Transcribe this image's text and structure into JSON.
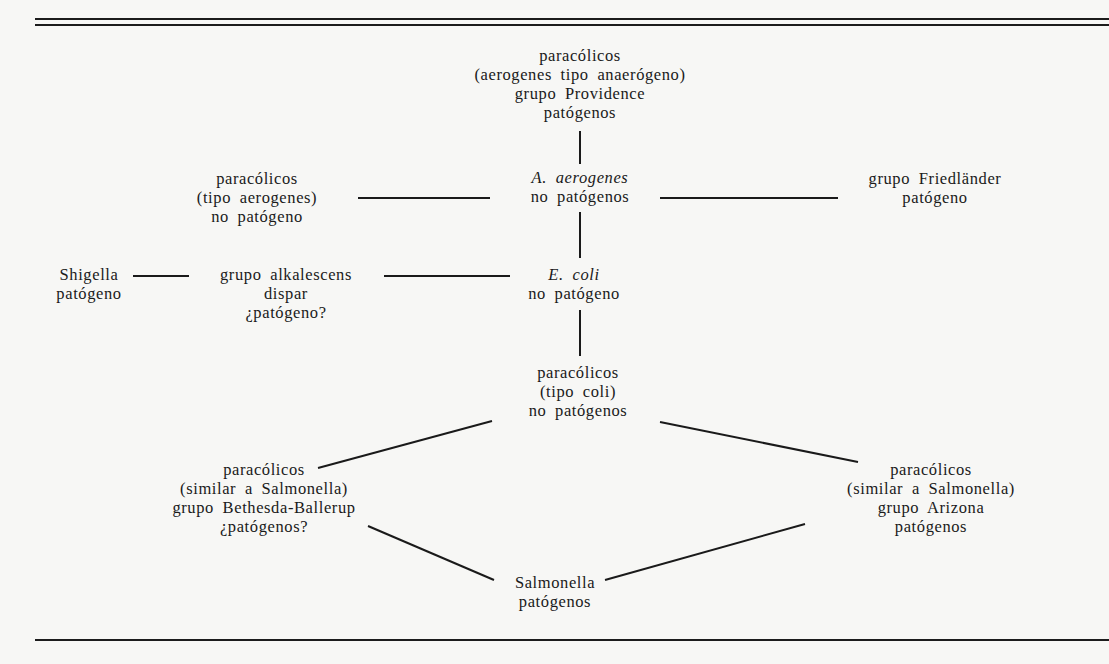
{
  "diagram": {
    "type": "relationship-diagram",
    "colors": {
      "background": "#f7f7f5",
      "ink": "#1a1a1a"
    },
    "nodes": {
      "providence": {
        "lines": [
          "paracólicos",
          "(aerogenes tipo anaerógeno)",
          "grupo Providence",
          "patógenos"
        ]
      },
      "aerogenes": {
        "name_genus": "A.",
        "name_species": "aerogenes",
        "status": "no patógenos"
      },
      "tipo_aerogenes": {
        "lines": [
          "paracólicos",
          "(tipo aerogenes)",
          "no patógeno"
        ]
      },
      "friedlander": {
        "lines": [
          "grupo Friedländer",
          "patógeno"
        ]
      },
      "shigella": {
        "lines": [
          "Shigella",
          "patógeno"
        ]
      },
      "alkalescens": {
        "lines": [
          "grupo alkalescens",
          "dispar",
          "¿patógeno?"
        ]
      },
      "ecoli": {
        "name_genus": "E.",
        "name_species": "coli",
        "status": "no patógeno"
      },
      "tipo_coli": {
        "lines": [
          "paracólicos",
          "(tipo coli)",
          "no patógenos"
        ]
      },
      "bethesda": {
        "lines": [
          "paracólicos",
          "(similar a Salmonella)",
          "grupo Bethesda-Ballerup",
          "¿patógenos?"
        ]
      },
      "arizona": {
        "lines": [
          "paracólicos",
          "(similar a Salmonella)",
          "grupo Arizona",
          "patógenos"
        ]
      },
      "salmonella": {
        "lines": [
          "Salmonella",
          "patógenos"
        ]
      }
    },
    "edges": [
      [
        "providence",
        "aerogenes"
      ],
      [
        "tipo_aerogenes",
        "aerogenes"
      ],
      [
        "aerogenes",
        "friedlander"
      ],
      [
        "aerogenes",
        "ecoli"
      ],
      [
        "shigella",
        "alkalescens"
      ],
      [
        "alkalescens",
        "ecoli"
      ],
      [
        "ecoli",
        "tipo_coli"
      ],
      [
        "tipo_coli",
        "bethesda"
      ],
      [
        "tipo_coli",
        "arizona"
      ],
      [
        "bethesda",
        "salmonella"
      ],
      [
        "arizona",
        "salmonella"
      ]
    ]
  }
}
